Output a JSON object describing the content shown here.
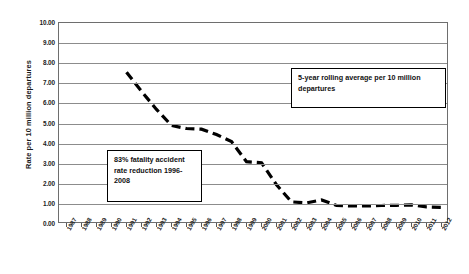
{
  "chart_data": {
    "type": "line",
    "title": "",
    "xlabel": "",
    "ylabel": "Rate per 10 million departures",
    "ylim": [
      0,
      10
    ],
    "ytick_labels": [
      "10.00",
      "9.00",
      "8.00",
      "7.00",
      "6.00",
      "5.00",
      "4.00",
      "3.00",
      "2.00",
      "1.00",
      "0.00"
    ],
    "ytick_values": [
      10,
      9,
      8,
      7,
      6,
      5,
      4,
      3,
      2,
      1,
      0
    ],
    "grid": true,
    "legend_position": "none",
    "categories": [
      "1987",
      "1988",
      "1989",
      "1990",
      "1991",
      "1992",
      "1993",
      "1994",
      "1995",
      "1996",
      "1997",
      "1998",
      "1999",
      "2000",
      "2001",
      "2002",
      "2003",
      "2004",
      "2005",
      "2006",
      "2007",
      "2008",
      "2009",
      "2010",
      "2011",
      "2012"
    ],
    "series": [
      {
        "name": "5-year rolling average per 10 million departures",
        "line_style": "dashed",
        "color": "#000000",
        "x": [
          "1991",
          "1992",
          "1993",
          "1994",
          "1995",
          "1996",
          "1997",
          "1998",
          "1999",
          "2000",
          "2001",
          "2002",
          "2003",
          "2004",
          "2005",
          "2006",
          "2007",
          "2008",
          "2009",
          "2010",
          "2011",
          "2012"
        ],
        "values": [
          7.55,
          6.6,
          5.7,
          4.9,
          4.75,
          4.72,
          4.45,
          4.1,
          3.1,
          3.05,
          1.95,
          1.1,
          1.05,
          1.2,
          0.92,
          0.9,
          0.9,
          0.92,
          0.93,
          0.95,
          0.85,
          0.83
        ]
      }
    ],
    "annotations": [
      {
        "name": "rolling-average-note",
        "text": "5-year rolling average per 10 million departures"
      },
      {
        "name": "reduction-note",
        "text": "83% fatality accident rate reduction 1996-2008"
      }
    ]
  }
}
